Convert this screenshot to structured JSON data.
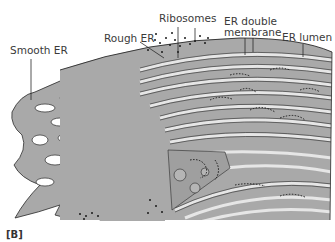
{
  "figure": {
    "panel_label": "[B]",
    "labels": {
      "smooth_er": "Smooth ER",
      "rough_er": "Rough ER",
      "ribosomes": "Ribosomes",
      "er_double_membrane_line1": "ER double",
      "er_double_membrane_line2": "membrane",
      "er_lumen": "ER lumen"
    },
    "colors": {
      "membrane_fill": "#a9a9a9",
      "lumen_stripe": "#e6e6e6",
      "outline": "#2a2a2a",
      "background": "#ffffff"
    }
  }
}
